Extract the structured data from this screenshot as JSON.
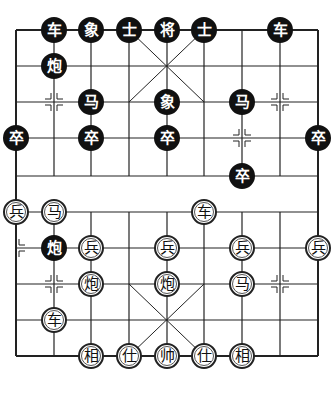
{
  "board": {
    "files_x": [
      16,
      54,
      91,
      129,
      167,
      204,
      242,
      280,
      318
    ],
    "ranks_y": [
      30,
      66,
      102,
      138,
      176,
      212,
      248,
      284,
      320,
      356
    ],
    "line_color": "#222222",
    "background": "#ffffff"
  },
  "pieces": [
    {
      "side": "black",
      "char": "车",
      "file": 1,
      "rank": 0
    },
    {
      "side": "black",
      "char": "象",
      "file": 2,
      "rank": 0
    },
    {
      "side": "black",
      "char": "士",
      "file": 3,
      "rank": 0
    },
    {
      "side": "black",
      "char": "将",
      "file": 4,
      "rank": 0
    },
    {
      "side": "black",
      "char": "士",
      "file": 5,
      "rank": 0
    },
    {
      "side": "black",
      "char": "车",
      "file": 7,
      "rank": 0
    },
    {
      "side": "black",
      "char": "炮",
      "file": 1,
      "rank": 1
    },
    {
      "side": "black",
      "char": "马",
      "file": 2,
      "rank": 2
    },
    {
      "side": "black",
      "char": "象",
      "file": 4,
      "rank": 2
    },
    {
      "side": "black",
      "char": "马",
      "file": 6,
      "rank": 2
    },
    {
      "side": "black",
      "char": "卒",
      "file": 0,
      "rank": 3
    },
    {
      "side": "black",
      "char": "卒",
      "file": 2,
      "rank": 3
    },
    {
      "side": "black",
      "char": "卒",
      "file": 4,
      "rank": 3
    },
    {
      "side": "black",
      "char": "卒",
      "file": 8,
      "rank": 3
    },
    {
      "side": "black",
      "char": "卒",
      "file": 6,
      "rank": 4
    },
    {
      "side": "red",
      "char": "兵",
      "file": 0,
      "rank": 5
    },
    {
      "side": "red",
      "char": "马",
      "file": 1,
      "rank": 5
    },
    {
      "side": "red",
      "char": "车",
      "file": 5,
      "rank": 5
    },
    {
      "side": "black",
      "char": "炮",
      "file": 1,
      "rank": 6
    },
    {
      "side": "red",
      "char": "兵",
      "file": 2,
      "rank": 6
    },
    {
      "side": "red",
      "char": "兵",
      "file": 4,
      "rank": 6
    },
    {
      "side": "red",
      "char": "兵",
      "file": 6,
      "rank": 6
    },
    {
      "side": "red",
      "char": "兵",
      "file": 8,
      "rank": 6
    },
    {
      "side": "red",
      "char": "炮",
      "file": 2,
      "rank": 7
    },
    {
      "side": "red",
      "char": "炮",
      "file": 4,
      "rank": 7
    },
    {
      "side": "red",
      "char": "马",
      "file": 6,
      "rank": 7
    },
    {
      "side": "red",
      "char": "车",
      "file": 1,
      "rank": 8
    },
    {
      "side": "red",
      "char": "相",
      "file": 2,
      "rank": 9
    },
    {
      "side": "red",
      "char": "仕",
      "file": 3,
      "rank": 9
    },
    {
      "side": "red",
      "char": "帅",
      "file": 4,
      "rank": 9
    },
    {
      "side": "red",
      "char": "仕",
      "file": 5,
      "rank": 9
    },
    {
      "side": "red",
      "char": "相",
      "file": 6,
      "rank": 9
    }
  ],
  "markers": [
    {
      "file": 1,
      "rank": 2
    },
    {
      "file": 7,
      "rank": 2
    },
    {
      "file": 6,
      "rank": 3
    },
    {
      "file": 0,
      "rank": 6
    },
    {
      "file": 1,
      "rank": 7
    },
    {
      "file": 7,
      "rank": 7
    }
  ]
}
